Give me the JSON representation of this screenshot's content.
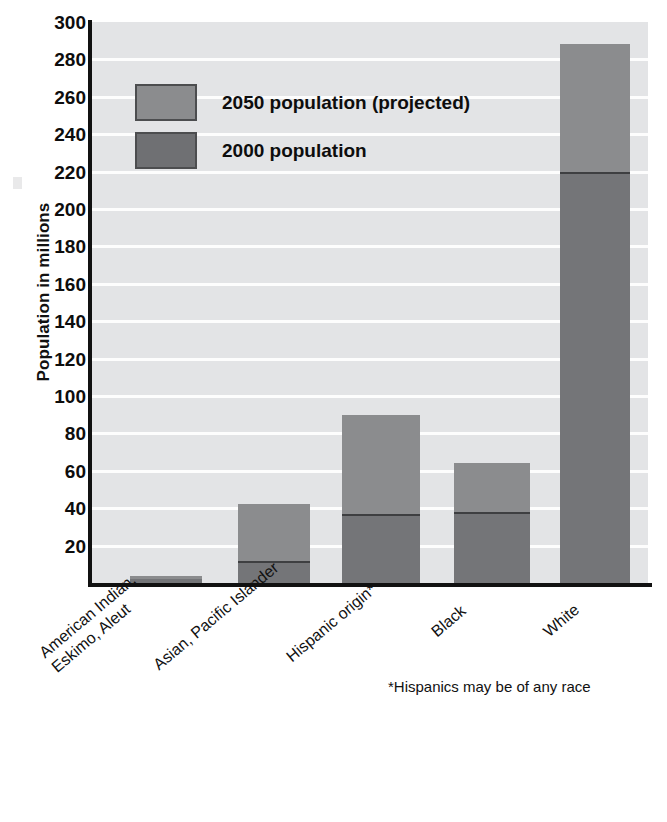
{
  "chart_data": {
    "type": "bar",
    "subtype": "stacked-vertical",
    "title": "",
    "xlabel": "",
    "ylabel": "Population in millions",
    "ylim": [
      0,
      300
    ],
    "ytick_step": 20,
    "yticks": [
      300,
      280,
      260,
      240,
      220,
      200,
      180,
      160,
      140,
      120,
      100,
      80,
      60,
      40,
      20
    ],
    "grid": true,
    "grid_orientation": "horizontal",
    "legend_position": "inside-top-left",
    "categories": [
      "American Indian, Eskimo, Aleut",
      "Asian, Pacific Islander",
      "Hispanic origin*",
      "Black",
      "White"
    ],
    "series": [
      {
        "name": "2000 population",
        "values": [
          2,
          12,
          37,
          38,
          220
        ]
      },
      {
        "name": "2050 population (projected)",
        "values": [
          4,
          42,
          90,
          64,
          288
        ]
      }
    ],
    "note": "The lighter segment is the projected 2050 total stacked above the darker 2000 value; bar tops equal the 2050 values.",
    "annotations": [
      "*Hispanics may be of any race"
    ]
  },
  "axis": {
    "y_title": "Population in millions",
    "tick_labels": [
      "300",
      "280",
      "260",
      "240",
      "220",
      "200",
      "180",
      "160",
      "140",
      "120",
      "100",
      "80",
      "60",
      "40",
      "20"
    ]
  },
  "legend": {
    "items": [
      {
        "label": "2050 population (projected)",
        "color": "#8b8c8e",
        "swatch": "legend-swatch-2050"
      },
      {
        "label": "2000 population",
        "color": "#6f7073",
        "swatch": "legend-swatch-2000"
      }
    ]
  },
  "categories": [
    {
      "line1": "American Indian,",
      "line2": "Eskimo, Aleut"
    },
    {
      "line1": "Asian, Pacific Islander",
      "line2": ""
    },
    {
      "line1": "Hispanic origin*",
      "line2": ""
    },
    {
      "line1": "Black",
      "line2": ""
    },
    {
      "line1": "White",
      "line2": ""
    }
  ],
  "footnote": "*Hispanics may be of any race",
  "colors": {
    "plot_background": "#e3e4e6",
    "gridline": "#fdfdfd",
    "bar_2050": "#8b8c8e",
    "bar_2000": "#747578",
    "axis": "#111111",
    "page_background": "#ffffff"
  }
}
